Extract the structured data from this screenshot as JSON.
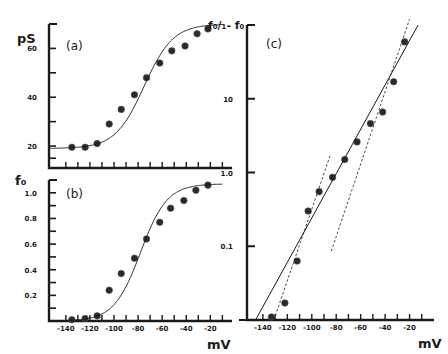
{
  "figure": {
    "caption_visible_fragment": ""
  },
  "chart_data": [
    {
      "id": "a",
      "type": "scatter",
      "panel_label": "(a)",
      "title": "",
      "xlabel": "mV",
      "ylabel": "pS",
      "xlim": [
        -154,
        -2
      ],
      "ylim": [
        11,
        70
      ],
      "yticks_labeled": [
        20,
        40,
        60
      ],
      "yticks_minor": [
        30,
        50
      ],
      "xticks_every": 10,
      "grid": false,
      "series": [
        {
          "name": "data",
          "marker": "filled-circle",
          "x": [
            -135,
            -124,
            -114,
            -104,
            -94,
            -83,
            -73,
            -62,
            -52,
            -41,
            -31,
            -22
          ],
          "y": [
            19.5,
            19.5,
            21,
            29,
            35,
            41,
            48,
            54,
            59,
            61,
            66,
            68
          ]
        },
        {
          "name": "fit",
          "style": "line",
          "model": "boltzmann",
          "params": {
            "min": 19,
            "max": 70,
            "v_half": -75,
            "slope": 12
          }
        }
      ]
    },
    {
      "id": "b",
      "type": "scatter",
      "panel_label": "(b)",
      "title": "",
      "xlabel": "mV",
      "ylabel": "f₀",
      "xlim": [
        -154,
        -2
      ],
      "ylim": [
        0,
        1.1
      ],
      "yticks_labeled": [
        0.2,
        0.4,
        0.6,
        0.8,
        1.0
      ],
      "ytick_labels": [
        "0.2",
        "0.4",
        "0.6",
        "0.8",
        "1.0"
      ],
      "xticks_labeled": [
        -140,
        -120,
        -100,
        -80,
        -60,
        -40,
        -20
      ],
      "xticks_every": 10,
      "grid": false,
      "series": [
        {
          "name": "data",
          "marker": "filled-circle",
          "x": [
            -135,
            -124,
            -114,
            -104,
            -94,
            -83,
            -73,
            -62,
            -53,
            -42,
            -32,
            -22
          ],
          "y": [
            0.01,
            0.02,
            0.04,
            0.24,
            0.37,
            0.49,
            0.64,
            0.77,
            0.88,
            0.94,
            1.02,
            1.06
          ]
        },
        {
          "name": "fit",
          "style": "line",
          "model": "boltzmann",
          "params": {
            "min": 0,
            "max": 1.07,
            "v_half": -78,
            "slope": 11
          }
        }
      ]
    },
    {
      "id": "c",
      "type": "scatter",
      "panel_label": "(c)",
      "title": "",
      "xlabel": "mV",
      "ylabel": "f₀/1-f₀",
      "yscale": "log",
      "xlim": [
        -153,
        0
      ],
      "ylim": [
        0.01,
        100
      ],
      "yticks_labeled": [
        0.1,
        1.0,
        10
      ],
      "ytick_labels": [
        "0.1",
        "1.0",
        "10"
      ],
      "xticks_labeled": [
        -140,
        -120,
        -100,
        -80,
        -60,
        -40,
        -20
      ],
      "xticks_every": 10,
      "grid": false,
      "series": [
        {
          "name": "data",
          "marker": "filled-circle",
          "x": [
            -133,
            -122,
            -112,
            -103,
            -94,
            -83,
            -73,
            -63,
            -52,
            -42,
            -33,
            -24
          ],
          "y": [
            0.011,
            0.017,
            0.063,
            0.3,
            0.55,
            0.86,
            1.5,
            2.6,
            4.6,
            6.6,
            17,
            59
          ]
        },
        {
          "name": "fit",
          "style": "solid-line",
          "from": [
            -146,
            0.01
          ],
          "to": [
            -13,
            100
          ]
        },
        {
          "name": "limiting-slope-left",
          "style": "dashed-line",
          "from": [
            -131,
            0.01
          ],
          "to": [
            -85,
            1.7
          ]
        },
        {
          "name": "limiting-slope-right",
          "style": "dashed-line",
          "from": [
            -84,
            0.086
          ],
          "to": [
            -20,
            120
          ]
        }
      ]
    }
  ],
  "axes_text": {
    "a_ylabel": "pS",
    "b_ylabel": "f₀",
    "c_ylabel": "f₀/₁- f₀",
    "a_panel": "(a)",
    "b_panel": "(b)",
    "c_panel": "(c)",
    "xunit": "mV"
  }
}
